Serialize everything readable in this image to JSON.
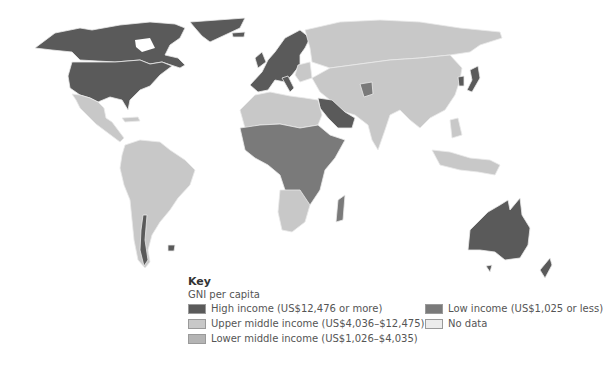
{
  "legend": {
    "title": "Key",
    "subtitle": "GNI per capita",
    "items": [
      {
        "label": "High income (US$12,476 or more)",
        "color": "#5a5a5a"
      },
      {
        "label": "Upper middle income (US$4,036–$12,475)",
        "color": "#c8c8c8"
      },
      {
        "label": "Lower middle income (US$1,026–$4,035)",
        "color": "#b4b4b4"
      },
      {
        "label": "Low income (US$1,025 or less)",
        "color": "#7a7a7a"
      },
      {
        "label": "No data",
        "color": "#ececec"
      }
    ]
  },
  "map": {
    "projection": "world",
    "colors": {
      "high": "#5a5a5a",
      "upper_middle": "#c8c8c8",
      "lower_middle": "#b4b4b4",
      "low": "#7a7a7a",
      "no_data": "#ececec",
      "border": "#e8e8e8",
      "sea": "#ffffff"
    }
  }
}
